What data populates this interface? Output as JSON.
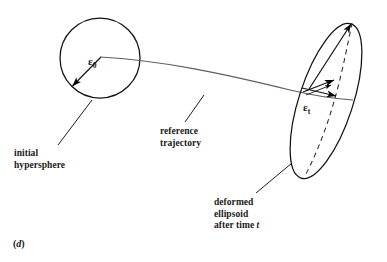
{
  "figure": {
    "caption": "(d)",
    "caption_italic_letter": "d",
    "labels": {
      "initial_hypersphere": "initial\nhypersphere",
      "reference_trajectory": "reference\ntrajectory",
      "deformed_ellipsoid": "deformed\nellipsoid\nafter time t",
      "deformed_ellipsoid_line1": "deformed",
      "deformed_ellipsoid_line2": "ellipsoid",
      "deformed_ellipsoid_line3_prefix": "after time ",
      "deformed_ellipsoid_line3_italic": "t"
    },
    "symbols": {
      "epsilon_zero_base": "ε",
      "epsilon_zero_sub": "0",
      "epsilon_t_base": "ε",
      "epsilon_t_sub": "t"
    },
    "icon_names": {
      "initial_hypersphere": "circle-shape",
      "deformed_ellipsoid": "tilted-ellipse-shape",
      "reference_trajectory": "curved-trajectory-line",
      "radius_arrow": "radius-arrow-icon",
      "stretch_arrows": "stretch-arrow-icon",
      "major_axis": "dashed-major-axis-line"
    },
    "colors": {
      "ink": "#000000",
      "background": "#ffffff",
      "trajectory": "#5a5a5a",
      "dashed": "#333333"
    },
    "geometry": {
      "circle_center_x": 100,
      "circle_center_y": 58,
      "circle_radius": 40,
      "ellipse_center_x": 326,
      "ellipse_center_y": 101,
      "ellipse_semi_major": 81,
      "ellipse_semi_minor": 27,
      "ellipse_rotation_deg": -72,
      "trajectory_start_x": 100,
      "trajectory_start_y": 58,
      "trajectory_end_x": 352,
      "trajectory_end_y": 100
    }
  }
}
